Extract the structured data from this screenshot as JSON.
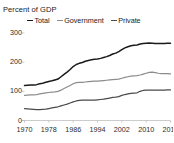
{
  "chart_data": {
    "type": "line",
    "title": "Percent of GDP",
    "xlabel": "",
    "ylabel": "",
    "ylim": [
      0,
      300
    ],
    "xlim": [
      1970,
      2018
    ],
    "grid": false,
    "legend_position": "top",
    "y_ticks": [
      "0",
      "100",
      "200",
      "300"
    ],
    "y_tick_values": [
      0,
      100,
      200,
      300
    ],
    "x_ticks": [
      "1970",
      "1978",
      "1986",
      "1994",
      "2002",
      "2010",
      "2018"
    ],
    "x_tick_values": [
      1970,
      1978,
      1986,
      1994,
      2002,
      2010,
      2018
    ],
    "x": [
      1970,
      1971,
      1972,
      1973,
      1974,
      1975,
      1976,
      1977,
      1978,
      1979,
      1980,
      1981,
      1982,
      1983,
      1984,
      1985,
      1986,
      1987,
      1988,
      1989,
      1990,
      1991,
      1992,
      1993,
      1994,
      1995,
      1996,
      1997,
      1998,
      1999,
      2000,
      2001,
      2002,
      2003,
      2004,
      2005,
      2006,
      2007,
      2008,
      2009,
      2010,
      2011,
      2012,
      2013,
      2014,
      2015,
      2016,
      2017,
      2018
    ],
    "series": [
      {
        "name": "Total",
        "color": "#1a1a1a",
        "values": [
          120,
          121,
          122,
          122,
          123,
          126,
          128,
          131,
          134,
          136,
          139,
          142,
          150,
          158,
          166,
          175,
          185,
          192,
          196,
          199,
          203,
          206,
          208,
          210,
          211,
          213,
          216,
          219,
          223,
          228,
          231,
          236,
          243,
          249,
          253,
          256,
          258,
          259,
          262,
          264,
          265,
          266,
          265,
          264,
          264,
          264,
          264,
          265,
          265
        ]
      },
      {
        "name": "Government",
        "color": "#8c8c8c",
        "values": [
          86,
          87,
          88,
          88,
          89,
          91,
          93,
          95,
          96,
          97,
          98,
          100,
          104,
          110,
          115,
          120,
          126,
          130,
          131,
          131,
          132,
          133,
          134,
          135,
          135,
          136,
          137,
          138,
          139,
          140,
          141,
          142,
          145,
          148,
          150,
          152,
          153,
          154,
          156,
          159,
          162,
          165,
          166,
          164,
          162,
          161,
          161,
          161,
          160
        ]
      },
      {
        "name": "Private",
        "color": "#4a4a4a",
        "values": [
          41,
          40,
          39,
          38,
          37,
          37,
          38,
          39,
          41,
          43,
          45,
          47,
          50,
          53,
          56,
          60,
          64,
          67,
          69,
          70,
          70,
          70,
          70,
          70,
          71,
          72,
          73,
          75,
          77,
          79,
          80,
          82,
          86,
          89,
          91,
          93,
          94,
          95,
          100,
          103,
          104,
          104,
          104,
          104,
          104,
          104,
          104,
          105,
          105
        ]
      }
    ]
  },
  "legend": {
    "items": [
      {
        "label": "Total",
        "color": "#1a1a1a"
      },
      {
        "label": "Government",
        "color": "#8c8c8c"
      },
      {
        "label": "Private",
        "color": "#4a4a4a"
      }
    ]
  }
}
